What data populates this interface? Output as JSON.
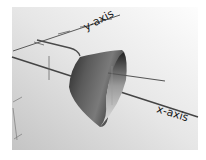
{
  "figure": {
    "type": "3d-surface-render",
    "object": "conical frustum surface",
    "axes": {
      "x_label": "x-axis",
      "y_label": "y-axis"
    },
    "colors": {
      "background_light": "#fafafa",
      "background_dark": "#c8c8c8",
      "axis_line": "#4a4a4a",
      "surface_dark": "#1e1e1e",
      "surface_mid": "#6a6a6a",
      "surface_light": "#d8d8d8"
    }
  }
}
